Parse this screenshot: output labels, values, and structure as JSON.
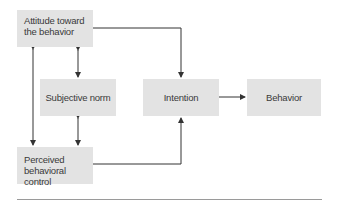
{
  "diagram": {
    "nodes": {
      "attitude": {
        "line1": "Attitude toward",
        "line2": "the behavior"
      },
      "subjective_norm": {
        "label": "Subjective norm"
      },
      "perceived_control": {
        "line1": "Perceived",
        "line2": "behavioral control"
      },
      "intention": {
        "label": "Intention"
      },
      "behavior": {
        "label": "Behavior"
      }
    },
    "edges": [
      {
        "from": "attitude",
        "to": "intention",
        "type": "directed"
      },
      {
        "from": "subjective_norm",
        "to": "intention",
        "type": "directed"
      },
      {
        "from": "perceived_control",
        "to": "intention",
        "type": "directed"
      },
      {
        "from": "intention",
        "to": "behavior",
        "type": "directed"
      },
      {
        "from": "attitude",
        "to": "subjective_norm",
        "type": "bidirectional"
      },
      {
        "from": "subjective_norm",
        "to": "perceived_control",
        "type": "bidirectional"
      },
      {
        "from": "attitude",
        "to": "perceived_control",
        "type": "bidirectional"
      }
    ],
    "colors": {
      "box_fill": "#e3e3e3",
      "line": "#333333",
      "text": "#3a3a3a",
      "rule": "#9a9a9a"
    }
  }
}
